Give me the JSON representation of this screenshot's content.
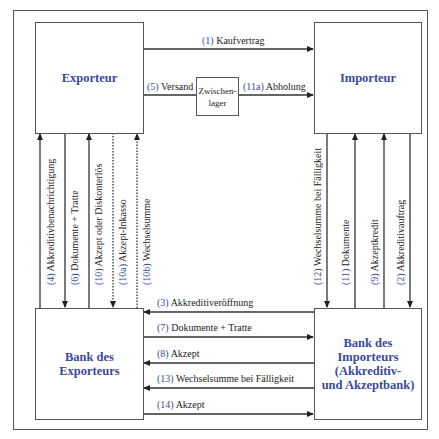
{
  "diagram": {
    "type": "flow-diagram",
    "colors": {
      "accent": "#3a4a9c",
      "line": "#333333",
      "border": "#555555"
    },
    "nodes": {
      "exporteur": {
        "label": "Exporteur"
      },
      "importeur": {
        "label": "Importeur"
      },
      "zwischenlager": {
        "line1": "Zwischen-",
        "line2": "lager"
      },
      "bank_exporteur": {
        "line1": "Bank des",
        "line2": "Exporteurs"
      },
      "bank_importeur": {
        "line1": "Bank des",
        "line2": "Importeurs",
        "line3": "(Akkreditiv-",
        "line4": "und Akzeptbank)"
      }
    },
    "edges": {
      "e1": {
        "num": "(1)",
        "text": "Kaufvertrag",
        "from": "Exporteur",
        "to": "Importeur",
        "direction": "both"
      },
      "e5": {
        "num": "(5)",
        "text": "Versand",
        "from": "Exporteur",
        "to": "Zwischenlager"
      },
      "e11a": {
        "num": "(11a)",
        "text": "Abholung",
        "from": "Zwischenlager",
        "to": "Importeur"
      },
      "e4": {
        "num": "(4)",
        "text": "Akkreditivbenachrichtigung",
        "from": "Bank des Exporteurs",
        "to": "Exporteur"
      },
      "e6": {
        "num": "(6)",
        "text": "Dokumente + Tratte",
        "from": "Exporteur",
        "to": "Bank des Exporteurs"
      },
      "e10": {
        "num": "(10)",
        "text": "Akzept oder Diskonterlös",
        "from": "Bank des Exporteurs",
        "to": "Exporteur"
      },
      "e10a": {
        "num": "(10a)",
        "text": "Akzept-Inkasso",
        "from": "Exporteur",
        "to": "Bank des Exporteurs",
        "style": "dotted"
      },
      "e10b": {
        "num": "(10b)",
        "text": "Wechselsumme",
        "from": "Bank des Exporteurs",
        "to": "Exporteur",
        "style": "dotted"
      },
      "e12": {
        "num": "(12)",
        "text": "Wechselsumme bei Fälligkeit",
        "from": "Importeur",
        "to": "Bank des Importeurs"
      },
      "e11": {
        "num": "(11)",
        "text": "Dokumente",
        "from": "Bank des Importeurs",
        "to": "Importeur"
      },
      "e9": {
        "num": "(9)",
        "text": "Akzeptkredit",
        "from": "Bank des Importeurs",
        "to": "Importeur"
      },
      "e2": {
        "num": "(2)",
        "text": "Akkreditivauftrag",
        "from": "Importeur",
        "to": "Bank des Importeurs"
      },
      "e3": {
        "num": "(3)",
        "text": "Akkreditiveröffnung",
        "from": "Bank des Importeurs",
        "to": "Bank des Exporteurs"
      },
      "e7": {
        "num": "(7)",
        "text": "Dokumente + Tratte",
        "from": "Bank des Exporteurs",
        "to": "Bank des Importeurs"
      },
      "e8": {
        "num": "(8)",
        "text": "Akzept",
        "from": "Bank des Importeurs",
        "to": "Bank des Exporteurs"
      },
      "e13": {
        "num": "(13)",
        "text": "Wechselsumme bei Fälligkeit",
        "from": "Bank des Importeurs",
        "to": "Bank des Exporteurs"
      },
      "e14": {
        "num": "(14)",
        "text": "Akzept",
        "from": "Bank des Exporteurs",
        "to": "Bank des Importeurs"
      }
    }
  }
}
